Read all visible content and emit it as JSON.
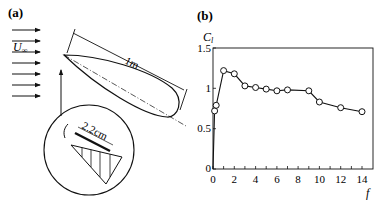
{
  "panel_a": {
    "label": "(a)",
    "freestream_label": "U",
    "freestream_subscript": "∞",
    "chord_label": "1m",
    "detail_label": "2.2cm"
  },
  "panel_b": {
    "label": "(b)"
  },
  "chart_data": {
    "type": "line",
    "title": "",
    "xlabel": "f",
    "ylabel": "C_l",
    "xlim": [
      0,
      15
    ],
    "ylim": [
      0,
      1.5
    ],
    "xticks": [
      0,
      2,
      4,
      6,
      8,
      10,
      12,
      14
    ],
    "yticks": [
      0,
      0.5,
      1,
      1.5
    ],
    "ytick_labels": [
      "0",
      "0.5",
      "1",
      "1.5"
    ],
    "xtick_labels": [
      "0",
      "2",
      "4",
      "6",
      "8",
      "10",
      "12",
      "14"
    ],
    "grid": false,
    "legend": null,
    "marker": "open-circle",
    "series": [
      {
        "name": "C_l",
        "x": [
          0,
          0.15,
          0.3,
          1,
          2,
          3,
          4,
          5,
          6,
          7,
          9,
          10,
          12,
          14
        ],
        "y": [
          0,
          0.72,
          0.79,
          1.22,
          1.18,
          1.03,
          1.01,
          0.99,
          0.97,
          0.98,
          0.97,
          0.83,
          0.76,
          0.71
        ],
        "markers": [
          false,
          true,
          true,
          true,
          true,
          true,
          true,
          true,
          true,
          true,
          true,
          true,
          true,
          true
        ]
      }
    ]
  }
}
